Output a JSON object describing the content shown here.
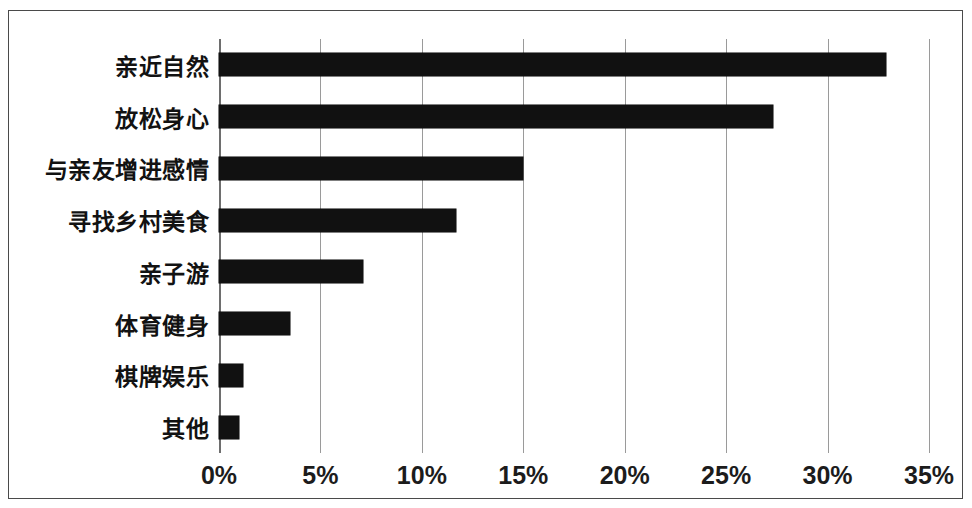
{
  "chart_data": {
    "type": "bar",
    "orientation": "horizontal",
    "title": "",
    "subtitle": "",
    "xlabel": "",
    "ylabel": "",
    "categories": [
      "亲近自然",
      "放松身心",
      "与亲友增进感情",
      "寻找乡村美食",
      "亲子游",
      "体育健身",
      "棋牌娱乐",
      "其他"
    ],
    "values": [
      32.9,
      27.3,
      15.0,
      11.7,
      7.1,
      3.5,
      1.2,
      1.0
    ],
    "value_format": "percent",
    "xlim": [
      0,
      35
    ],
    "x_ticks": [
      0,
      5,
      10,
      15,
      20,
      25,
      30,
      35
    ],
    "x_tick_labels": [
      "0%",
      "5%",
      "10%",
      "15%",
      "20%",
      "25%",
      "30%",
      "35%"
    ],
    "grid": "vertical",
    "legend": "none",
    "bar_color": "#111111",
    "gridline_color": "#9a9a9a",
    "border_color": "#4a4a4a",
    "background_color": "#ffffff"
  }
}
